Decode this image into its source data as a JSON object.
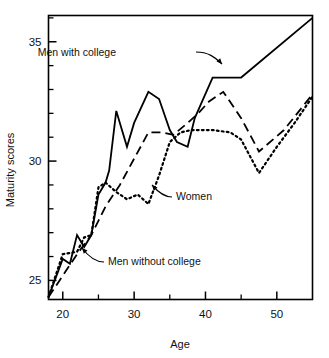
{
  "chart_data": {
    "type": "line",
    "title": "",
    "xlabel": "Age",
    "ylabel": "Maturity scores",
    "xlim": [
      18,
      55
    ],
    "ylim": [
      24.2,
      36.1
    ],
    "grid": false,
    "legend_position": "inline-annotations",
    "xticks_major": [
      20,
      30,
      40,
      50
    ],
    "xticks_minor": [
      25,
      35,
      45
    ],
    "yticks_major": [
      25,
      30,
      35
    ],
    "yticks_minor": [
      26,
      27,
      28,
      29,
      31,
      32,
      33,
      34,
      36
    ],
    "xtick_labels": [
      "20",
      "30",
      "40",
      "50"
    ],
    "ytick_labels": [
      "25",
      "30",
      "35"
    ],
    "series": [
      {
        "name": "Men with college",
        "style": "solid",
        "x": [
          18,
          20,
          21,
          22,
          23,
          24,
          25,
          26,
          26.5,
          27.5,
          29,
          30,
          32,
          33.5,
          35,
          36,
          37.5,
          38.5,
          41,
          45,
          55
        ],
        "values": [
          24.3,
          25.9,
          25.7,
          26.9,
          26.4,
          26.9,
          28.6,
          29.1,
          29.6,
          32.1,
          30.6,
          31.6,
          32.9,
          32.6,
          31.3,
          30.8,
          30.6,
          31.8,
          33.5,
          33.5,
          36.0
        ]
      },
      {
        "name": "Men without college",
        "style": "dashed",
        "x": [
          18,
          22,
          24,
          26,
          28,
          30,
          32,
          34,
          35.5,
          37.5,
          39,
          40.5,
          42.5,
          45,
          47.5,
          51,
          55
        ],
        "values": [
          24.3,
          26.1,
          26.9,
          28.1,
          29.0,
          30.1,
          31.2,
          31.2,
          31.1,
          31.6,
          32.0,
          32.5,
          32.9,
          31.8,
          30.4,
          31.3,
          32.8
        ]
      },
      {
        "name": "Women",
        "style": "dotted",
        "x": [
          18,
          20,
          22,
          23,
          24,
          25,
          26,
          27.5,
          29,
          30.5,
          32,
          33.5,
          35,
          36.5,
          38,
          41,
          43.5,
          45,
          47.5,
          50,
          52.5,
          55
        ],
        "values": [
          24.3,
          26.1,
          26.2,
          26.8,
          26.9,
          28.9,
          29.1,
          28.7,
          28.4,
          28.6,
          28.2,
          29.4,
          30.8,
          31.2,
          31.3,
          31.3,
          31.2,
          30.9,
          29.5,
          30.6,
          31.6,
          32.7
        ]
      }
    ],
    "annotations": [
      {
        "label": "Men with college",
        "text_x": 116,
        "text_y": 56,
        "leader": "M196,52 C208,52 215,57 222,64"
      },
      {
        "label": "Women",
        "text_x": 176,
        "text_y": 200,
        "leader": "M172,197 C165,197 158,192 152,185"
      },
      {
        "label": "Men without college",
        "text_x": 108,
        "text_y": 265,
        "leader": "M104,262 C96,262 88,256 82,248"
      }
    ]
  },
  "axis": {
    "xlabel": "Age",
    "ylabel": "Maturity scores"
  },
  "colors": {
    "line": "#000000",
    "frame": "#000000",
    "background": "#ffffff"
  }
}
